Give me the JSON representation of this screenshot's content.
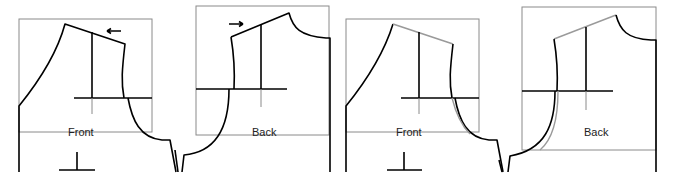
{
  "diagram": {
    "panels": [
      {
        "id": "front-before",
        "label": "Front",
        "arrow": "left"
      },
      {
        "id": "back-before",
        "label": "Back",
        "arrow": "right"
      },
      {
        "id": "front-after",
        "label": "Front",
        "arrow": "none"
      },
      {
        "id": "back-after",
        "label": "Back",
        "arrow": "none"
      }
    ],
    "colors": {
      "outline": "#000000",
      "frame": "#8a8a8a",
      "adjusted_line": "#9a9a9a"
    }
  }
}
